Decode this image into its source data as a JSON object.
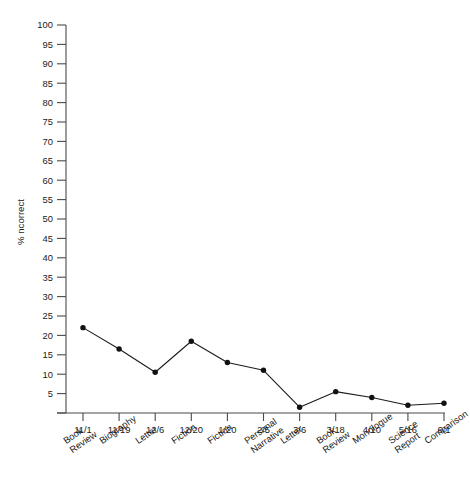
{
  "chart_data": {
    "type": "line",
    "title": "",
    "xlabel": "",
    "ylabel": "% ncorrect",
    "ylim": [
      0,
      100
    ],
    "ytick_step": 5,
    "yticks": [
      100,
      95,
      90,
      85,
      80,
      75,
      70,
      65,
      60,
      55,
      50,
      45,
      40,
      35,
      30,
      25,
      20,
      15,
      10,
      5
    ],
    "grid": false,
    "legend": false,
    "legend_position": "none",
    "line_color": "#1c1c1c",
    "marker_color": "#111111",
    "background_color": "#ffffff",
    "categories": [
      "11/1",
      "11/19",
      "12/6",
      "12/20",
      "1/20",
      "2/5",
      "3/6",
      "3/18",
      "4/10",
      "5/16",
      "6/1"
    ],
    "category_sublabels": [
      [
        "Book",
        "Review"
      ],
      [
        "Biography"
      ],
      [
        "Letter"
      ],
      [
        "Fiction"
      ],
      [
        "Fiction"
      ],
      [
        "Personal",
        "Narrative"
      ],
      [
        "Letter"
      ],
      [
        "Book",
        "Review"
      ],
      [
        "Monologue"
      ],
      [
        "Science",
        "Report"
      ],
      [
        "Comparison"
      ]
    ],
    "values": [
      22,
      16.5,
      10.5,
      18.5,
      13,
      11,
      1.5,
      5.5,
      4,
      2,
      2.5
    ]
  }
}
